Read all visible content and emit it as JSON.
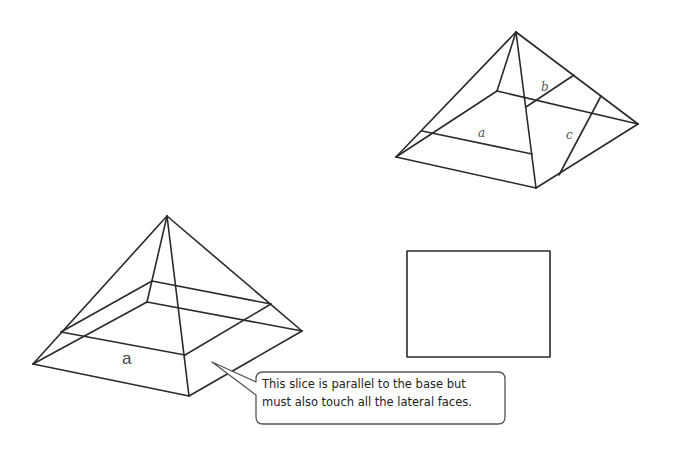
{
  "diagram": {
    "type": "pyramid cross-sections",
    "top_right_pyramid": {
      "labels": {
        "a": "a",
        "b": "b",
        "c": "c"
      }
    },
    "bottom_left_pyramid": {
      "labels": {
        "a": "a"
      }
    },
    "rectangle": {
      "description": "cross-section shape"
    },
    "callout": {
      "line1": "This slice is parallel to the base but",
      "line2": "must also touch all the lateral faces."
    },
    "colors": {
      "stroke": "#2a2a2a",
      "label": "#555555",
      "background": "#ffffff"
    }
  }
}
